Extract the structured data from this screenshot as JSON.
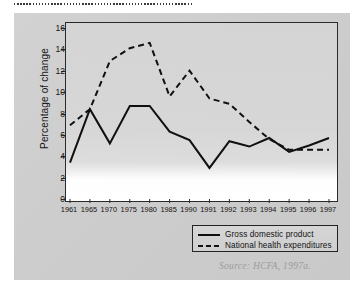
{
  "figure": {
    "source_note": "Source: HCFA, 1997a."
  },
  "legend": {
    "items": [
      {
        "label": "Gross domestic product",
        "style": "solid",
        "color": "#101010"
      },
      {
        "label": "National health expenditures",
        "style": "dashed",
        "color": "#101010"
      }
    ]
  },
  "chart_data": {
    "type": "line",
    "title": "",
    "subtitle": "",
    "xlabel": "",
    "ylabel": "Percentage of change",
    "categories": [
      "1961",
      "1965",
      "1970",
      "1975",
      "1980",
      "1985",
      "1990",
      "1991",
      "1992",
      "1993",
      "1994",
      "1995",
      "1996",
      "1997"
    ],
    "x_tick_labels": [
      "1961",
      "1965",
      "1970",
      "1975",
      "1980",
      "1985",
      "1990",
      "1991",
      "1992",
      "1993",
      "1994",
      "1995",
      "1996",
      "1997"
    ],
    "y_tick_labels": [
      "0",
      "2",
      "4",
      "6",
      "8",
      "10",
      "12",
      "14",
      "16"
    ],
    "y_ticks": [
      0,
      2,
      4,
      6,
      8,
      10,
      12,
      14,
      16
    ],
    "ylim": [
      0,
      16
    ],
    "grid": false,
    "legend_position": "bottom-right",
    "series": [
      {
        "name": "Gross domestic product",
        "style": "solid",
        "color": "#101010",
        "values": [
          3.5,
          8.5,
          5.3,
          8.8,
          8.8,
          6.4,
          5.6,
          3.0,
          5.5,
          5.0,
          5.8,
          4.5,
          5.1,
          5.8
        ]
      },
      {
        "name": "National health expenditures",
        "style": "dashed",
        "color": "#101010",
        "values": [
          7.0,
          8.5,
          13.0,
          14.2,
          14.7,
          9.7,
          12.1,
          9.5,
          9.0,
          7.3,
          5.7,
          4.7,
          4.7,
          4.7
        ]
      }
    ],
    "annotations": [
      "Source: HCFA, 1997a."
    ]
  }
}
